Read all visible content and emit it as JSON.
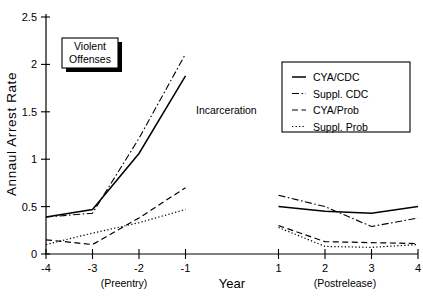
{
  "chart_data": {
    "type": "line",
    "title": "",
    "badge": "Violent\nOffenses",
    "badge_line1": "Violent",
    "badge_line2": "Offenses",
    "xlabel": "Year",
    "ylabel": "Annaul Arrest Rate",
    "xlim": [
      -4,
      4
    ],
    "ylim": [
      0,
      2.5
    ],
    "grid": false,
    "legend_position": "upper-right",
    "y_ticks": [
      "0",
      "0.5",
      "1",
      "1.5",
      "2",
      "2.5"
    ],
    "y_tick_values": [
      0,
      0.5,
      1,
      1.5,
      2,
      2.5
    ],
    "x_ticks_left": [
      "-4",
      "-3",
      "-2",
      "-1"
    ],
    "x_ticks_right": [
      "1",
      "2",
      "3",
      "4"
    ],
    "x_tick_values_left": [
      -4,
      -3,
      -2,
      -1
    ],
    "x_tick_values_right": [
      1,
      2,
      3,
      4
    ],
    "period_left_label": "(Preentry)",
    "period_right_label": "(Postrelease)",
    "annotations": [
      {
        "text": "Incarceration",
        "x": -1.55,
        "y": 1.35
      }
    ],
    "series": [
      {
        "name": "CYA/CDC",
        "style": "solid",
        "preentry_x": [
          -4,
          -3,
          -2,
          -1
        ],
        "preentry_values": [
          0.39,
          0.47,
          1.06,
          1.88
        ],
        "postrelease_x": [
          1,
          2,
          3,
          4
        ],
        "postrelease_values": [
          0.5,
          0.45,
          0.43,
          0.5
        ]
      },
      {
        "name": "Suppl. CDC",
        "style": "dashdot",
        "preentry_x": [
          -4,
          -3,
          -2,
          -1
        ],
        "preentry_values": [
          0.39,
          0.43,
          1.22,
          2.11
        ],
        "postrelease_x": [
          1,
          2,
          3,
          4
        ],
        "postrelease_values": [
          0.62,
          0.5,
          0.29,
          0.38
        ]
      },
      {
        "name": "CYA/Prob",
        "style": "dashed",
        "preentry_x": [
          -4,
          -3,
          -2,
          -1
        ],
        "preentry_values": [
          0.15,
          0.1,
          0.38,
          0.7
        ],
        "postrelease_x": [
          1,
          2,
          3,
          4
        ],
        "postrelease_values": [
          0.3,
          0.13,
          0.12,
          0.11
        ]
      },
      {
        "name": "Suppl. Prob",
        "style": "dotted",
        "preentry_x": [
          -4,
          -3,
          -2,
          -1
        ],
        "preentry_values": [
          0.1,
          0.22,
          0.33,
          0.47
        ],
        "postrelease_x": [
          1,
          2,
          3,
          4
        ],
        "postrelease_values": [
          0.28,
          0.08,
          0.07,
          0.1
        ]
      }
    ]
  }
}
